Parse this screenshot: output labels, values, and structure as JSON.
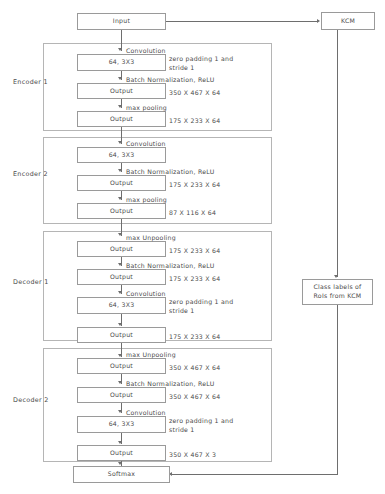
{
  "diagram": {
    "input": {
      "label": "Input"
    },
    "kcm": {
      "label": "KCM"
    },
    "class_labels": {
      "label": "Class labels of RoIs from KCM"
    },
    "softmax": {
      "label": "Softmax"
    },
    "stages": [
      {
        "name": "Encoder 1",
        "steps": [
          {
            "op": "Convolution",
            "box": "64, 3X3",
            "side": "zero padding 1 and stride 1"
          },
          {
            "op": "Batch Normalization, ReLU",
            "box": "Output",
            "side": "350 X 467 X 64"
          },
          {
            "op": "max pooling",
            "box": "Output",
            "side": "175 X 233 X 64"
          }
        ]
      },
      {
        "name": "Encoder 2",
        "steps": [
          {
            "op": "Convolution",
            "box": "64, 3X3",
            "side": ""
          },
          {
            "op": "Batch Normalization, ReLU",
            "box": "Output",
            "side": "175 X 233 X 64"
          },
          {
            "op": "max pooling",
            "box": "Output",
            "side": "87 X 116 X 64"
          }
        ]
      },
      {
        "name": "Decoder 1",
        "steps": [
          {
            "op": "max Unpooling",
            "box": "Output",
            "side": "175 X 233 X 64"
          },
          {
            "op": "Batch Normalization, ReLU",
            "box": "Output",
            "side": "175 X 233 X 64"
          },
          {
            "op": "Convolution",
            "box": "64, 3X3",
            "side": "zero padding 1 and stride 1"
          },
          {
            "op": "",
            "box": "Output",
            "side": "175 X 233 X 64"
          }
        ]
      },
      {
        "name": "Decoder 2",
        "steps": [
          {
            "op": "max Unpooling",
            "box": "Output",
            "side": "350 X 467 X 64"
          },
          {
            "op": "Batch Normalization, ReLU",
            "box": "Output",
            "side": "350 X 467 X 64"
          },
          {
            "op": "Convolution",
            "box": "64, 3X3",
            "side": "zero padding 1 and stride 1"
          },
          {
            "op": "",
            "box": "Output",
            "side": "350 X 467 X 3"
          }
        ]
      }
    ]
  }
}
